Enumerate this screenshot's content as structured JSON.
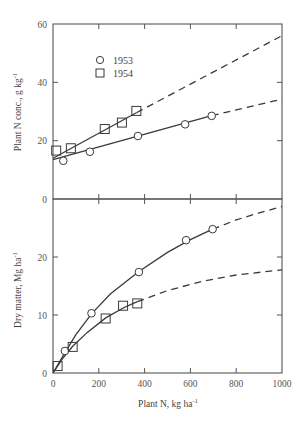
{
  "chart_data": [
    {
      "type": "line",
      "panel": "top",
      "title": "",
      "xlabel": "Plant N, kg ha-1",
      "ylabel": "Plant N conc., g kg-1",
      "xlim": [
        0,
        1000
      ],
      "ylim": [
        0,
        60
      ],
      "xticks": [
        0,
        200,
        400,
        600,
        800,
        1000
      ],
      "yticks": [
        0,
        20,
        40,
        60
      ],
      "ytick_labels": [
        "0",
        "20",
        "40",
        "60"
      ],
      "grid": false,
      "legend": {
        "position": "upper-left",
        "entries": [
          {
            "label": "1953",
            "marker": "circle"
          },
          {
            "label": "1954",
            "marker": "square"
          }
        ]
      },
      "series": [
        {
          "name": "1953",
          "marker": "circle",
          "points": [
            [
              45,
              13.1
            ],
            [
              161,
              16.2
            ],
            [
              371,
              21.6
            ],
            [
              577,
              25.6
            ],
            [
              693,
              28.5
            ]
          ],
          "fit_solid": [
            [
              0,
              13.5
            ],
            [
              693,
              28.6
            ]
          ],
          "fit_dashed": [
            [
              693,
              28.6
            ],
            [
              1000,
              34.2
            ]
          ]
        },
        {
          "name": "1954",
          "marker": "square",
          "points": [
            [
              14,
              16.6
            ],
            [
              78,
              17.4
            ],
            [
              226,
              24.0
            ],
            [
              301,
              26.2
            ],
            [
              364,
              30.2
            ]
          ],
          "fit_solid": [
            [
              0,
              14.0
            ],
            [
              364,
              29.6
            ]
          ],
          "fit_dashed": [
            [
              364,
              29.6
            ],
            [
              1000,
              56.0
            ]
          ]
        }
      ]
    },
    {
      "type": "line",
      "panel": "bottom",
      "title": "",
      "xlabel": "Plant N, kg ha-1",
      "ylabel": "Dry matter, Mg ha-1",
      "xlim": [
        0,
        1000
      ],
      "ylim": [
        0,
        30
      ],
      "xticks": [
        0,
        200,
        400,
        600,
        800,
        1000
      ],
      "xtick_labels": [
        "0",
        "200",
        "400",
        "600",
        "800",
        "1000"
      ],
      "yticks": [
        0,
        10,
        20,
        30
      ],
      "ytick_labels": [
        "0",
        "10",
        "20"
      ],
      "grid": false,
      "series": [
        {
          "name": "1953",
          "marker": "circle",
          "points": [
            [
              52,
              3.8
            ],
            [
              168,
              10.3
            ],
            [
              375,
              17.4
            ],
            [
              581,
              22.9
            ],
            [
              697,
              24.8
            ]
          ],
          "fit_solid": [
            [
              0,
              0
            ],
            [
              50,
              3.4
            ],
            [
              100,
              6.6
            ],
            [
              168,
              10.2
            ],
            [
              250,
              13.6
            ],
            [
              375,
              17.5
            ],
            [
              500,
              20.8
            ],
            [
              600,
              23.0
            ],
            [
              697,
              24.8
            ]
          ],
          "fit_dashed": [
            [
              697,
              24.8
            ],
            [
              800,
              26.4
            ],
            [
              900,
              27.6
            ],
            [
              1000,
              28.7
            ]
          ]
        },
        {
          "name": "1954",
          "marker": "square",
          "points": [
            [
              20,
              1.2
            ],
            [
              86,
              4.5
            ],
            [
              230,
              9.4
            ],
            [
              306,
              11.6
            ],
            [
              368,
              12.0
            ]
          ],
          "fit_solid": [
            [
              0,
              0
            ],
            [
              40,
              2.4
            ],
            [
              86,
              4.6
            ],
            [
              150,
              7.0
            ],
            [
              230,
              9.5
            ],
            [
              306,
              11.2
            ],
            [
              368,
              12.3
            ]
          ],
          "fit_dashed": [
            [
              368,
              12.3
            ],
            [
              500,
              14.2
            ],
            [
              650,
              15.8
            ],
            [
              800,
              16.9
            ],
            [
              1000,
              17.8
            ]
          ]
        }
      ]
    }
  ],
  "labels": {
    "top_ylabel_main": "Plant N conc., g kg",
    "top_ylabel_sup": "-1",
    "bottom_ylabel_main": "Dry matter, Mg ha",
    "bottom_ylabel_sup": "-1",
    "xlabel_main": "Plant N, kg ha",
    "xlabel_sup": "-1",
    "legend_1953": "1953",
    "legend_1954": "1954"
  },
  "colors": {
    "ink": "#3a3a3a",
    "axis": "#555555"
  }
}
